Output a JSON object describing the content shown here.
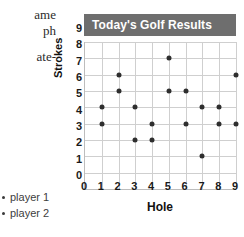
{
  "page_text_fragments": [
    {
      "text": "ame"
    },
    {
      "text": "ph"
    },
    {
      "text": "ate-"
    }
  ],
  "legend": {
    "items": [
      {
        "label": "player 1",
        "marker": "dot-marker",
        "color": "#3a3a3a"
      },
      {
        "label": "player 2",
        "marker": "dot-marker",
        "color": "#3a3a3a"
      }
    ]
  },
  "colors": {
    "title_bar": "#6e6e6e",
    "title_text": "#ffffff",
    "grid": "#cfcfcf",
    "axis": "#bdbdbd",
    "dot": "#2e2e2e"
  },
  "chart_data": {
    "type": "scatter",
    "title": "Today's Golf Results",
    "xlabel": "Hole",
    "ylabel": "Strokes",
    "xlim": [
      0,
      9
    ],
    "ylim": [
      0,
      9
    ],
    "xticks": [
      "0",
      "1",
      "2",
      "3",
      "4",
      "5",
      "6",
      "7",
      "8",
      "9"
    ],
    "yticks": [
      "0",
      "1",
      "2",
      "3",
      "4",
      "5",
      "6",
      "7",
      "8",
      "9"
    ],
    "grid": true,
    "legend_position": "left-outside",
    "series": [
      {
        "name": "player 1",
        "x": [
          1,
          2,
          3,
          4,
          5,
          6,
          7,
          8,
          9
        ],
        "values": [
          5,
          7,
          5,
          4,
          8,
          6,
          5,
          5,
          7
        ]
      },
      {
        "name": "player 2",
        "x": [
          1,
          2,
          3,
          4,
          5,
          6,
          7,
          8,
          9
        ],
        "values": [
          4,
          6,
          3,
          3,
          6,
          4,
          2,
          4,
          4
        ]
      }
    ],
    "points": [
      {
        "hole": 1,
        "strokes": 5
      },
      {
        "hole": 1,
        "strokes": 4
      },
      {
        "hole": 2,
        "strokes": 7
      },
      {
        "hole": 2,
        "strokes": 6
      },
      {
        "hole": 3,
        "strokes": 5
      },
      {
        "hole": 3,
        "strokes": 3
      },
      {
        "hole": 4,
        "strokes": 4
      },
      {
        "hole": 4,
        "strokes": 3
      },
      {
        "hole": 5,
        "strokes": 8
      },
      {
        "hole": 5,
        "strokes": 6
      },
      {
        "hole": 6,
        "strokes": 6
      },
      {
        "hole": 6,
        "strokes": 4
      },
      {
        "hole": 7,
        "strokes": 5
      },
      {
        "hole": 7,
        "strokes": 2
      },
      {
        "hole": 8,
        "strokes": 5
      },
      {
        "hole": 8,
        "strokes": 4
      },
      {
        "hole": 9,
        "strokes": 7
      },
      {
        "hole": 9,
        "strokes": 4
      }
    ]
  }
}
